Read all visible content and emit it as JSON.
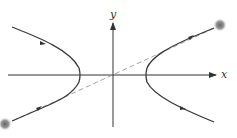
{
  "diagram": {
    "type": "hyperbola-with-asymptote",
    "axes": {
      "x_label": "x",
      "y_label": "y"
    },
    "elements": [
      "x-axis with arrow",
      "y-axis with arrow",
      "left hyperbola branch with direction arrows",
      "right hyperbola branch with direction arrows",
      "dashed asymptote through origin",
      "two gray dots at asymptote ends"
    ],
    "colors": {
      "curve": "#3a3a3a",
      "axis": "#333333",
      "asymptote": "#9a9a9a",
      "dot": "#777777"
    }
  }
}
